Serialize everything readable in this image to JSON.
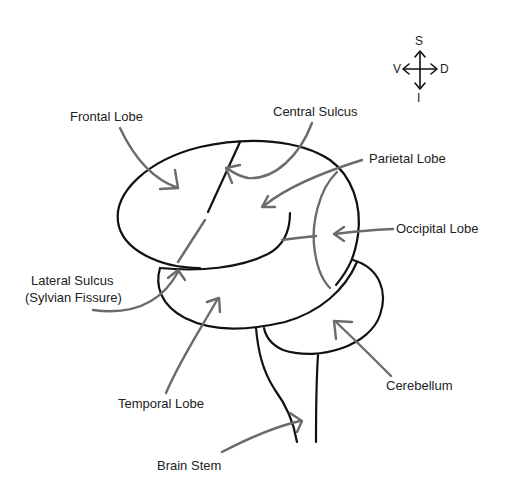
{
  "diagram": {
    "colors": {
      "outline": "#111111",
      "arrow": "#6b6b6b",
      "text": "#222222",
      "background": "#ffffff"
    },
    "compass": {
      "top": "S",
      "left": "V",
      "right": "D",
      "bottom": "I"
    },
    "labels": {
      "frontal_lobe": "Frontal Lobe",
      "central_sulcus": "Central Sulcus",
      "parietal_lobe": "Parietal Lobe",
      "occipital_lobe": "Occipital Lobe",
      "lateral_sulcus_line1": "Lateral Sulcus",
      "lateral_sulcus_line2": "(Sylvian Fissure)",
      "temporal_lobe": "Temporal Lobe",
      "cerebellum": "Cerebellum",
      "brain_stem": "Brain Stem"
    }
  }
}
